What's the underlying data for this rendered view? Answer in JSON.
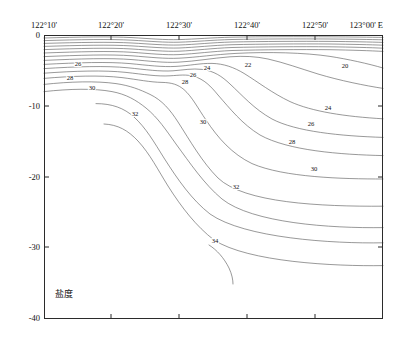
{
  "figure": {
    "caption": "盐度",
    "caption_meaning": "salinity",
    "background": "#ffffff",
    "frame_color": "#2b2b2b",
    "contour_color": "#5a5a5a"
  },
  "chart_data": {
    "type": "line",
    "subtype": "contour-section",
    "title": "",
    "xlabel": "",
    "ylabel": "",
    "grid": false,
    "legend": "none",
    "xlim": [
      122.1667,
      123.0
    ],
    "ylim": [
      -40,
      0
    ],
    "x_axis": {
      "unit": "degrees-minutes East",
      "ticks": [
        {
          "label": "122°10'",
          "value": 122.1667,
          "px": 44
        },
        {
          "label": "122°20'",
          "value": 122.3333,
          "px": 111
        },
        {
          "label": "122°30'",
          "value": 122.5,
          "px": 179
        },
        {
          "label": "122°40'",
          "value": 122.6667,
          "px": 247
        },
        {
          "label": "122°50'",
          "value": 122.8333,
          "px": 315
        },
        {
          "label": "123°00' E",
          "value": 123.0,
          "px": 383
        }
      ]
    },
    "y_axis": {
      "unit": "m depth",
      "ticks": [
        {
          "label": "0",
          "value": 0,
          "px": 35
        },
        {
          "label": "-10",
          "value": -10,
          "px": 106
        },
        {
          "label": "-20",
          "value": -20,
          "px": 177
        },
        {
          "label": "-30",
          "value": -30,
          "px": 247
        },
        {
          "label": "-40",
          "value": -40,
          "px": 318
        }
      ]
    },
    "contour_levels": [
      20,
      21,
      22,
      23,
      24,
      25,
      26,
      27,
      28,
      29,
      30,
      31,
      32,
      33,
      34
    ],
    "labeled_contours": [
      {
        "level": "26",
        "x": 78,
        "y": 64
      },
      {
        "level": "28",
        "x": 70,
        "y": 78
      },
      {
        "level": "30",
        "x": 92,
        "y": 88
      },
      {
        "level": "24",
        "x": 207,
        "y": 68
      },
      {
        "level": "26",
        "x": 193,
        "y": 75
      },
      {
        "level": "28",
        "x": 185,
        "y": 82
      },
      {
        "level": "22",
        "x": 248,
        "y": 65
      },
      {
        "level": "20",
        "x": 345,
        "y": 66
      },
      {
        "level": "32",
        "x": 135,
        "y": 114
      },
      {
        "level": "30",
        "x": 203,
        "y": 122
      },
      {
        "level": "24",
        "x": 328,
        "y": 108
      },
      {
        "level": "26",
        "x": 311,
        "y": 124
      },
      {
        "level": "28",
        "x": 292,
        "y": 142
      },
      {
        "level": "30",
        "x": 314,
        "y": 169
      },
      {
        "level": "32",
        "x": 236,
        "y": 187
      },
      {
        "level": "34",
        "x": 215,
        "y": 241
      }
    ]
  }
}
